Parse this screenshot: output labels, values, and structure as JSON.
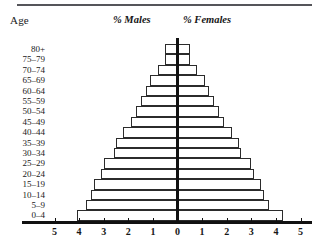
{
  "headings": {
    "age": "Age",
    "males": "% Males",
    "females": "% Females"
  },
  "chart_data": {
    "type": "bar",
    "subtype": "population-pyramid",
    "title": "",
    "xlabel": "",
    "ylabel": "Age",
    "grid": false,
    "legend": [
      "% Males",
      "% Females"
    ],
    "legend_position": "top",
    "categories": [
      "80+",
      "75-79",
      "70-74",
      "65-69",
      "60-64",
      "55-59",
      "50-54",
      "45-49",
      "40-44",
      "35-39",
      "30-34",
      "25-29",
      "20-24",
      "15-19",
      "10-14",
      "5-9",
      "0-4"
    ],
    "x_ticks_left": [
      5,
      4,
      3,
      2,
      1,
      0
    ],
    "x_ticks_right": [
      0,
      1,
      2,
      3,
      4,
      5
    ],
    "xlim": [
      -5,
      5
    ],
    "axis_unit": "percent",
    "series": [
      {
        "name": "% Males",
        "side": "left",
        "values": [
          0.5,
          0.5,
          0.8,
          1.1,
          1.3,
          1.5,
          1.7,
          1.9,
          2.2,
          2.5,
          2.6,
          3.0,
          3.1,
          3.4,
          3.5,
          3.7,
          4.1
        ]
      },
      {
        "name": "% Females",
        "side": "right",
        "values": [
          0.5,
          0.5,
          0.8,
          1.1,
          1.3,
          1.5,
          1.7,
          1.9,
          2.2,
          2.5,
          2.6,
          3.0,
          3.1,
          3.4,
          3.5,
          3.7,
          4.3
        ]
      }
    ]
  }
}
